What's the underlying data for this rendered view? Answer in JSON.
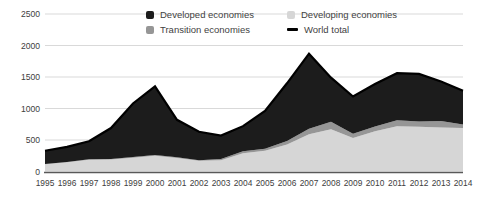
{
  "chart_data": {
    "type": "area",
    "stacked": true,
    "title": "",
    "xlabel": "",
    "ylabel": "",
    "x": [
      1995,
      1996,
      1997,
      1998,
      1999,
      2000,
      2001,
      2002,
      2003,
      2004,
      2005,
      2006,
      2007,
      2008,
      2009,
      2010,
      2011,
      2012,
      2013,
      2014
    ],
    "series": [
      {
        "name": "Developed economies",
        "shape": "area",
        "color": "#1c1c1c",
        "values": [
          210,
          240,
          285,
          490,
          850,
          1090,
          595,
          450,
          370,
          400,
          600,
          915,
          1190,
          700,
          590,
          675,
          745,
          755,
          630,
          535
        ]
      },
      {
        "name": "Developing economies",
        "shape": "area",
        "color": "#d6d6d6",
        "values": [
          115,
          145,
          185,
          190,
          220,
          250,
          215,
          170,
          180,
          290,
          330,
          430,
          590,
          670,
          530,
          640,
          720,
          710,
          700,
          690
        ]
      },
      {
        "name": "Transition economies",
        "shape": "area",
        "color": "#969696",
        "values": [
          5,
          5,
          10,
          10,
          10,
          10,
          10,
          10,
          20,
          30,
          30,
          55,
          90,
          120,
          70,
          75,
          95,
          85,
          100,
          55
        ]
      },
      {
        "name": "World total",
        "shape": "line",
        "color": "#000000",
        "values": [
          330,
          390,
          480,
          690,
          1080,
          1350,
          820,
          630,
          570,
          720,
          960,
          1400,
          1870,
          1490,
          1190,
          1390,
          1560,
          1550,
          1430,
          1280
        ]
      }
    ],
    "stack_bottom_to_top": [
      "Developing economies",
      "Transition economies",
      "Developed economies"
    ],
    "ylim": [
      0,
      2500
    ],
    "yticks": [
      0,
      500,
      1000,
      1500,
      2000,
      2500
    ],
    "grid": "horizontal",
    "legend_position": "top-center",
    "colors": {
      "gridline": "#d9d9d9",
      "axis_line": "#595959",
      "tick_text": "#404040",
      "background": "#ffffff"
    }
  }
}
